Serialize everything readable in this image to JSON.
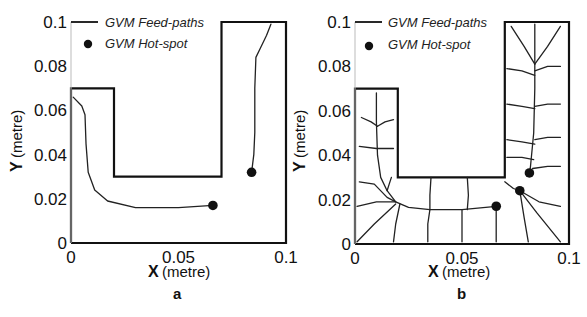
{
  "chart_data": [
    {
      "type": "line",
      "panel_label": "a",
      "title": "",
      "xlabel_bold": "X",
      "xlabel_unit": "(metre)",
      "ylabel_bold": "Y",
      "ylabel_unit": "(metre)",
      "xlim": [
        0,
        0.1
      ],
      "ylim": [
        0,
        0.1
      ],
      "xticks": [
        "0",
        "0.05",
        "0.1"
      ],
      "yticks": [
        "0",
        "0.02",
        "0.04",
        "0.06",
        "0.08",
        "0.1"
      ],
      "grid": false,
      "legend": {
        "position": "upper-left",
        "entries": [
          "GVM Feed-paths",
          "GVM Hot-spot"
        ]
      },
      "domain_outline": [
        [
          0,
          0
        ],
        [
          0.1,
          0
        ],
        [
          0.1,
          0.1
        ],
        [
          0.07,
          0.1
        ],
        [
          0.07,
          0.03
        ],
        [
          0.02,
          0.03
        ],
        [
          0.02,
          0.07
        ],
        [
          0,
          0.07
        ],
        [
          0,
          0
        ]
      ],
      "feed_paths": [
        [
          [
            0.001,
            0.066
          ],
          [
            0.005,
            0.062
          ],
          [
            0.0065,
            0.058
          ],
          [
            0.007,
            0.045
          ],
          [
            0.008,
            0.032
          ],
          [
            0.011,
            0.024
          ],
          [
            0.017,
            0.019
          ],
          [
            0.03,
            0.016
          ],
          [
            0.05,
            0.016
          ],
          [
            0.066,
            0.017
          ]
        ],
        [
          [
            0.093,
            0.099
          ],
          [
            0.091,
            0.094
          ],
          [
            0.088,
            0.088
          ],
          [
            0.086,
            0.084
          ],
          [
            0.0855,
            0.07
          ],
          [
            0.0855,
            0.05
          ],
          [
            0.085,
            0.04
          ],
          [
            0.084,
            0.032
          ]
        ]
      ],
      "hot_spots": [
        [
          0.066,
          0.017
        ],
        [
          0.084,
          0.032
        ]
      ]
    },
    {
      "type": "line",
      "panel_label": "b",
      "title": "",
      "xlabel_bold": "X",
      "xlabel_unit": "(metre)",
      "ylabel_bold": "Y",
      "ylabel_unit": "(metre)",
      "xlim": [
        0,
        0.1
      ],
      "ylim": [
        0,
        0.1
      ],
      "xticks": [
        "0",
        "0.05",
        "0.1"
      ],
      "yticks": [
        "0",
        "0.02",
        "0.04",
        "0.06",
        "0.08",
        "0.1"
      ],
      "grid": false,
      "legend": {
        "position": "upper-left",
        "entries": [
          "GVM Feed-paths",
          "GVM Hot-spot"
        ]
      },
      "domain_outline": [
        [
          0,
          0
        ],
        [
          0.1,
          0
        ],
        [
          0.1,
          0.1
        ],
        [
          0.07,
          0.1
        ],
        [
          0.07,
          0.03
        ],
        [
          0.02,
          0.03
        ],
        [
          0.02,
          0.07
        ],
        [
          0,
          0.07
        ],
        [
          0,
          0
        ]
      ],
      "feed_paths": [
        [
          [
            0.01,
            0.068
          ],
          [
            0.01,
            0.055
          ],
          [
            0.0105,
            0.04
          ],
          [
            0.012,
            0.03
          ],
          [
            0.015,
            0.024
          ],
          [
            0.019,
            0.019
          ],
          [
            0.025,
            0.0165
          ],
          [
            0.035,
            0.0155
          ],
          [
            0.05,
            0.0155
          ],
          [
            0.066,
            0.017
          ]
        ],
        [
          [
            0.003,
            0.057
          ],
          [
            0.0075,
            0.055
          ],
          [
            0.0105,
            0.053
          ]
        ],
        [
          [
            0.0105,
            0.053
          ],
          [
            0.014,
            0.055
          ],
          [
            0.018,
            0.056
          ]
        ],
        [
          [
            0.002,
            0.044
          ],
          [
            0.01,
            0.043
          ],
          [
            0.018,
            0.043
          ]
        ],
        [
          [
            0.002,
            0.028
          ],
          [
            0.009,
            0.027
          ],
          [
            0.015,
            0.021
          ],
          [
            0.019,
            0.019
          ]
        ],
        [
          [
            0.001,
            0.017
          ],
          [
            0.01,
            0.019
          ],
          [
            0.019,
            0.019
          ]
        ],
        [
          [
            0.001,
            0.001
          ],
          [
            0.009,
            0.009
          ],
          [
            0.019,
            0.018
          ]
        ],
        [
          [
            0.018,
            0.001
          ],
          [
            0.019,
            0.009
          ],
          [
            0.021,
            0.018
          ]
        ],
        [
          [
            0.034,
            0.001
          ],
          [
            0.034,
            0.009
          ],
          [
            0.035,
            0.0155
          ]
        ],
        [
          [
            0.05,
            0.001
          ],
          [
            0.05,
            0.008
          ],
          [
            0.05,
            0.0155
          ]
        ],
        [
          [
            0.066,
            0.001
          ],
          [
            0.066,
            0.008
          ],
          [
            0.066,
            0.017
          ]
        ],
        [
          [
            0.035,
            0.0155
          ],
          [
            0.035,
            0.022
          ],
          [
            0.0355,
            0.03
          ]
        ],
        [
          [
            0.0525,
            0.0155
          ],
          [
            0.053,
            0.022
          ],
          [
            0.0525,
            0.03
          ]
        ],
        [
          [
            0.017,
            0.03
          ],
          [
            0.016,
            0.027
          ],
          [
            0.015,
            0.024
          ]
        ],
        [
          [
            0.084,
            0.099
          ],
          [
            0.084,
            0.08
          ],
          [
            0.084,
            0.07
          ],
          [
            0.0835,
            0.05
          ],
          [
            0.082,
            0.035
          ],
          [
            0.0815,
            0.032
          ]
        ],
        [
          [
            0.073,
            0.098
          ],
          [
            0.079,
            0.089
          ],
          [
            0.084,
            0.081
          ]
        ],
        [
          [
            0.096,
            0.098
          ],
          [
            0.09,
            0.089
          ],
          [
            0.084,
            0.081
          ]
        ],
        [
          [
            0.071,
            0.079
          ],
          [
            0.078,
            0.078
          ],
          [
            0.084,
            0.076
          ]
        ],
        [
          [
            0.084,
            0.078
          ],
          [
            0.09,
            0.08
          ],
          [
            0.096,
            0.08
          ]
        ],
        [
          [
            0.071,
            0.063
          ],
          [
            0.078,
            0.062
          ],
          [
            0.084,
            0.061
          ]
        ],
        [
          [
            0.084,
            0.062
          ],
          [
            0.09,
            0.063
          ],
          [
            0.096,
            0.063
          ]
        ],
        [
          [
            0.071,
            0.047
          ],
          [
            0.078,
            0.046
          ],
          [
            0.084,
            0.045
          ]
        ],
        [
          [
            0.084,
            0.047
          ],
          [
            0.09,
            0.048
          ],
          [
            0.096,
            0.048
          ]
        ],
        [
          [
            0.071,
            0.039
          ],
          [
            0.078,
            0.039
          ],
          [
            0.0835,
            0.038
          ]
        ],
        [
          [
            0.083,
            0.034
          ],
          [
            0.09,
            0.035
          ],
          [
            0.096,
            0.035
          ]
        ],
        [
          [
            0.07,
            0.028
          ],
          [
            0.074,
            0.025
          ],
          [
            0.077,
            0.024
          ]
        ],
        [
          [
            0.077,
            0.024
          ],
          [
            0.086,
            0.019
          ],
          [
            0.096,
            0.017
          ]
        ],
        [
          [
            0.077,
            0.024
          ],
          [
            0.085,
            0.014
          ],
          [
            0.096,
            0.001
          ]
        ],
        [
          [
            0.077,
            0.024
          ],
          [
            0.079,
            0.012
          ],
          [
            0.081,
            0.001
          ]
        ]
      ],
      "hot_spots": [
        [
          0.066,
          0.017
        ],
        [
          0.0815,
          0.032
        ],
        [
          0.077,
          0.024
        ]
      ]
    }
  ]
}
